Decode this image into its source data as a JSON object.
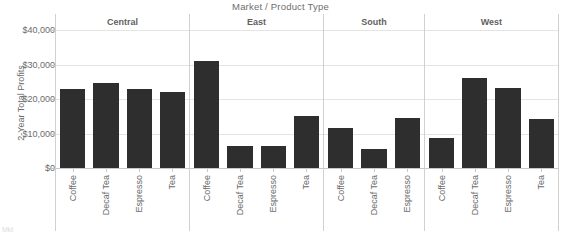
{
  "chart_data": {
    "type": "bar",
    "title": "Market / Product Type",
    "xlabel": "",
    "ylabel": "2-Year Total Profits",
    "ylim": [
      0,
      40000
    ],
    "grid": true,
    "legend": "none",
    "bar_color": "#2e2e2e",
    "y_ticks": [
      {
        "value": 40000,
        "label": "$40,000"
      },
      {
        "value": 30000,
        "label": "$30,000"
      },
      {
        "value": 20000,
        "label": "$20,000"
      },
      {
        "value": 10000,
        "label": "$10,000"
      },
      {
        "value": 0,
        "label": "$0"
      }
    ],
    "panels": [
      {
        "name": "Central",
        "categories": [
          "Coffee",
          "Decaf Tea",
          "Espresso",
          "Tea"
        ],
        "values": [
          23000,
          24500,
          23000,
          22000
        ]
      },
      {
        "name": "East",
        "categories": [
          "Coffee",
          "Decaf Tea",
          "Espresso",
          "Tea"
        ],
        "values": [
          31000,
          6500,
          6300,
          15000
        ]
      },
      {
        "name": "South",
        "categories": [
          "Coffee",
          "Decaf Tea",
          "Espresso"
        ],
        "values": [
          11500,
          5500,
          14500
        ]
      },
      {
        "name": "West",
        "categories": [
          "Coffee",
          "Decaf Tea",
          "Espresso",
          "Tea"
        ],
        "values": [
          8800,
          26000,
          23200,
          14300
        ]
      }
    ]
  },
  "footer": {
    "artifact_text": "Mkt"
  }
}
